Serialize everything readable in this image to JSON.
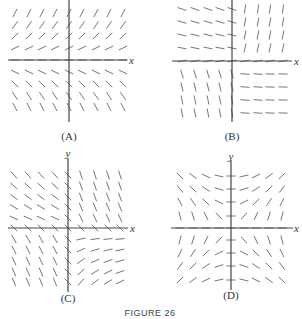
{
  "figure": {
    "caption": "FIGURE 26"
  },
  "panels": [
    {
      "id": "A",
      "label": "(A)",
      "origin": [
        69,
        60
      ],
      "x_extent": [
        8,
        127
      ],
      "y_extent": [
        0,
        122
      ],
      "x_label": "x",
      "y_label": "",
      "x_label_pos": [
        129,
        64
      ],
      "label_pos": [
        69,
        140
      ],
      "grid_cols": [
        -54,
        -40,
        -27,
        -14,
        0,
        13,
        27,
        40,
        54
      ],
      "grid_rows": [
        -47,
        -35,
        -24,
        -12,
        0,
        12,
        24,
        36,
        47
      ],
      "field": "y"
    },
    {
      "id": "B",
      "label": "(B)",
      "origin": [
        232,
        61
      ],
      "x_extent": [
        172,
        292
      ],
      "y_extent": [
        0,
        122
      ],
      "x_label": "x",
      "y_label": "",
      "x_label_pos": [
        294,
        65
      ],
      "label_pos": [
        232,
        140
      ],
      "grid_cols": [
        -50,
        -37,
        -24,
        -12,
        0,
        13,
        26,
        38,
        51
      ],
      "grid_rows": [
        -52,
        -39,
        -26,
        -13,
        0,
        13,
        26,
        39,
        52
      ],
      "field": "B"
    },
    {
      "id": "C",
      "label": "(C)",
      "origin": [
        68,
        228
      ],
      "x_extent": [
        8,
        128
      ],
      "y_extent": [
        158,
        292
      ],
      "x_label": "x",
      "y_label": "y",
      "x_label_pos": [
        130,
        232
      ],
      "y_label_pos": [
        68,
        157
      ],
      "label_pos": [
        68,
        302
      ],
      "grid_cols": [
        -54,
        -40,
        -27,
        -13,
        0,
        13,
        27,
        40,
        52
      ],
      "grid_rows": [
        -53,
        -42,
        -31,
        -21,
        -10,
        0,
        11,
        22,
        33,
        44,
        54
      ],
      "field": "C"
    },
    {
      "id": "D",
      "label": "(D)",
      "origin": [
        231,
        228
      ],
      "x_extent": [
        171,
        293
      ],
      "y_extent": [
        160,
        290
      ],
      "x_label": "x",
      "y_label": "y",
      "x_label_pos": [
        294,
        232
      ],
      "y_label_pos": [
        231,
        160
      ],
      "label_pos": [
        231,
        299
      ],
      "grid_cols": [
        -51,
        -38,
        -25,
        -12,
        0,
        13,
        25,
        38,
        51
      ],
      "grid_rows": [
        -52,
        -39,
        -26,
        -12,
        0,
        12,
        25,
        38,
        52
      ],
      "field": "D"
    }
  ]
}
